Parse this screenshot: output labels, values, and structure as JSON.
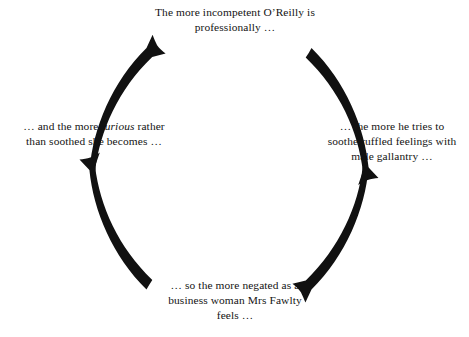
{
  "diagram": {
    "type": "vicious-circle-cycle",
    "direction": "clockwise",
    "arc_color": "#111111",
    "text_color": "#131313",
    "background_color": "#ffffff",
    "nodes": [
      {
        "id": "top",
        "position": "top",
        "lines": [
          "The more incompetent O’Reilly is",
          "professionally …"
        ],
        "text": "The more incompetent O’Reilly is professionally …"
      },
      {
        "id": "right",
        "position": "right",
        "lines": [
          "… the more he tries to",
          "soothe ruffled feelings with",
          "male gallantry …"
        ],
        "text": "… the more he tries to soothe ruffled feelings with male gallantry …"
      },
      {
        "id": "bottom",
        "position": "bottom",
        "lines": [
          "… so the more negated as a",
          "business woman Mrs Fawlty",
          "feels …"
        ],
        "text": "… so the more negated as a business woman Mrs Fawlty feels …"
      },
      {
        "id": "left",
        "position": "left",
        "lines_html": "… and the more <em>furious</em> rather<br>than soothed she becomes …",
        "text": "… and the more furious rather than soothed she becomes …",
        "emphasis_word": "furious"
      }
    ],
    "arrows": [
      {
        "id": "left-to-top",
        "from": "left",
        "to": "top",
        "label": "arc-arrow-left-to-top"
      },
      {
        "id": "top-to-right",
        "from": "top",
        "to": "right",
        "label": "arc-arrow-top-to-right"
      },
      {
        "id": "right-to-bottom",
        "from": "right",
        "to": "bottom",
        "label": "arc-arrow-right-to-bottom"
      },
      {
        "id": "bottom-to-left",
        "from": "bottom",
        "to": "left",
        "label": "arc-arrow-bottom-to-left"
      }
    ]
  }
}
